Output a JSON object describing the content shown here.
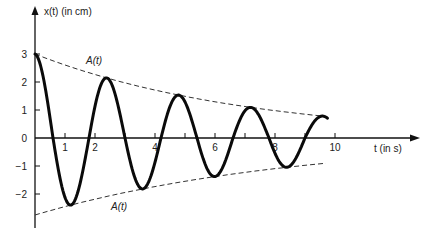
{
  "chart_data": {
    "type": "line",
    "title": "",
    "xlabel": "t (in s)",
    "ylabel": "x(t) (in cm)",
    "xlim": [
      0,
      13.8
    ],
    "ylim": [
      -3.2,
      4.0
    ],
    "x_ticks": [
      1,
      2,
      3,
      4,
      5,
      6,
      7,
      8,
      9,
      10
    ],
    "x_tick_labels": [
      "1",
      "2",
      "4",
      "6",
      "8",
      "10"
    ],
    "x_tick_label_values": [
      1,
      2,
      4,
      6,
      8,
      10
    ],
    "y_ticks": [
      3,
      2,
      1,
      0,
      -1,
      -2
    ],
    "y_tick_labels": [
      "3",
      "2",
      "1",
      "0",
      "−1",
      "−2"
    ],
    "grid": false,
    "legend": null,
    "series": [
      {
        "name": "x(t)",
        "style": "solid-thick",
        "model": "3*exp(-0.14 t)*cos(2*pi*t/2.4)",
        "t_range": [
          0,
          9.75
        ],
        "x": [
          0,
          1.2,
          2.4,
          3.6,
          4.8,
          6.0,
          7.2,
          8.4,
          9.4,
          9.75
        ],
        "values": [
          3.0,
          -2.45,
          2.2,
          -1.9,
          1.6,
          -1.45,
          1.2,
          -1.05,
          0.8,
          0.3
        ]
      },
      {
        "name": "A(t)",
        "style": "dashed",
        "x": [
          0,
          9.7
        ],
        "values": [
          3.0,
          0.77
        ]
      },
      {
        "name": "-A(t)",
        "style": "dashed",
        "x": [
          0,
          9.7
        ],
        "values": [
          -2.75,
          -0.9
        ]
      }
    ],
    "annotations": [
      {
        "text": "A(t)",
        "x": 1.7,
        "y": 2.6
      },
      {
        "text": "A(t)",
        "x": 2.7,
        "y": -2.5
      }
    ]
  },
  "labels": {
    "y_axis": "x(t)  (in cm)",
    "x_axis": "t  (in s)",
    "upper_envelope": "A(t)",
    "lower_envelope": "A(t)"
  },
  "ticks": {
    "x": [
      "1",
      "2",
      "4",
      "6",
      "8",
      "10"
    ],
    "y": [
      "3",
      "2",
      "1",
      "0",
      "−1",
      "−2"
    ]
  }
}
